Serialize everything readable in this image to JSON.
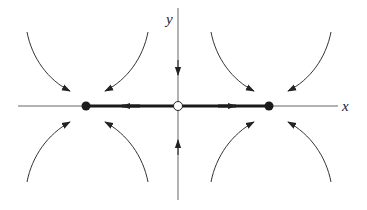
{
  "diagram": {
    "type": "phase-portrait",
    "axes": {
      "x_label": "x",
      "y_label": "y"
    },
    "fixed_points": [
      {
        "name": "left-stable-node",
        "kind": "filled"
      },
      {
        "name": "origin-saddle",
        "kind": "open"
      },
      {
        "name": "right-stable-node",
        "kind": "filled"
      }
    ],
    "colors": {
      "ink": "#222222",
      "axis": "#555555",
      "background": "#ffffff"
    }
  }
}
